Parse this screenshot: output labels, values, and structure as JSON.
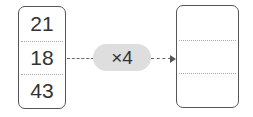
{
  "input_array": {
    "values": [
      "21",
      "18",
      "43"
    ]
  },
  "operation": {
    "label": "×4"
  },
  "output_array": {
    "values": [
      "",
      "",
      ""
    ]
  },
  "colors": {
    "border": "#555555",
    "pill_background": "#dedede",
    "text": "#333333",
    "divider": "#aaaaaa"
  }
}
